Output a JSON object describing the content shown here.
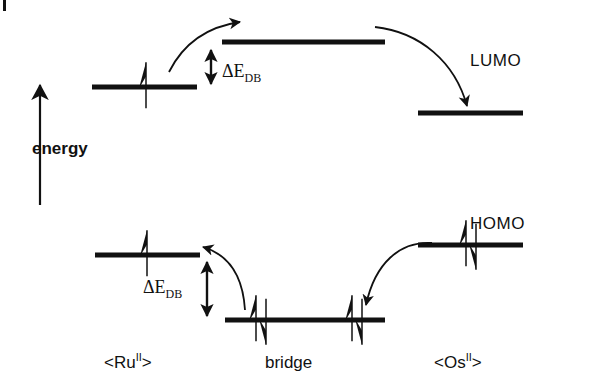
{
  "figure": {
    "type": "molecular-orbital-energy-diagram",
    "background_color": "#ffffff",
    "line_color": "#111111"
  },
  "axis": {
    "label": "energy",
    "direction": "up",
    "x": 40,
    "y_bottom": 205,
    "y_top": 85,
    "label_x": 32,
    "label_y": 140
  },
  "orbital_labels": {
    "lumo": "LUMO",
    "homo": "HOMO",
    "lumo_x": 470,
    "lumo_y": 52,
    "homo_x": 470,
    "homo_y": 215
  },
  "gap_labels": [
    {
      "name": "upper-gap",
      "text": "ΔE",
      "subscript": "DB",
      "x": 222,
      "y": 62,
      "arrow_x": 211,
      "arrow_top": 44,
      "arrow_bottom": 90
    },
    {
      "name": "lower-gap",
      "text": "ΔE",
      "subscript": "DB",
      "x": 143,
      "y": 278,
      "arrow_x": 207,
      "arrow_top": 256,
      "arrow_bottom": 322
    }
  ],
  "species_labels": [
    {
      "name": "ruthenium",
      "text": "<Ru",
      "superscript": "II",
      "tail": ">",
      "x": 104,
      "y": 352
    },
    {
      "name": "bridge",
      "text": "bridge",
      "superscript": "",
      "tail": "",
      "x": 265,
      "y": 352
    },
    {
      "name": "osmium",
      "text": "<Os",
      "superscript": "II",
      "tail": ">",
      "x": 434,
      "y": 352
    }
  ],
  "levels": [
    {
      "name": "ru-lumo",
      "site": "Ru",
      "orbital": "LUMO",
      "x1": 92,
      "x2": 197,
      "y": 87,
      "electrons": [
        {
          "type": "single-up",
          "x": 146
        }
      ]
    },
    {
      "name": "bridge-lumo",
      "site": "bridge",
      "orbital": "LUMO",
      "x1": 222,
      "x2": 385,
      "y": 42,
      "electrons": []
    },
    {
      "name": "os-lumo",
      "site": "Os",
      "orbital": "LUMO",
      "x1": 418,
      "x2": 523,
      "y": 113,
      "electrons": []
    },
    {
      "name": "ru-homo",
      "site": "Ru",
      "orbital": "HOMO",
      "x1": 95,
      "x2": 200,
      "y": 255,
      "electrons": [
        {
          "type": "single-up",
          "x": 147
        }
      ]
    },
    {
      "name": "bridge-homo",
      "site": "bridge",
      "orbital": "HOMO",
      "x1": 225,
      "x2": 385,
      "y": 320,
      "electrons": [
        {
          "type": "pair",
          "x": 256
        },
        {
          "type": "pair",
          "x": 352
        }
      ]
    },
    {
      "name": "os-homo",
      "site": "Os",
      "orbital": "HOMO",
      "x1": 418,
      "x2": 523,
      "y": 245,
      "electrons": [
        {
          "type": "pair",
          "x": 466
        }
      ]
    }
  ],
  "transfer_arrows": [
    {
      "name": "electron-transfer-ru-to-bridge",
      "path": "M 169 72 C 183 44 205 27 240 22",
      "direction": "up-right"
    },
    {
      "name": "electron-transfer-bridge-to-os",
      "path": "M 375 27 C 420 32 455 62 467 106",
      "direction": "down-right"
    },
    {
      "name": "hole-transfer-bridge-to-ru",
      "path": "M 245 310 C 243 278 230 255 203 247",
      "direction": "up-left"
    },
    {
      "name": "hole-transfer-os-to-bridge",
      "path": "M 432 243 C 400 241 375 263 366 305",
      "direction": "down-left"
    }
  ]
}
